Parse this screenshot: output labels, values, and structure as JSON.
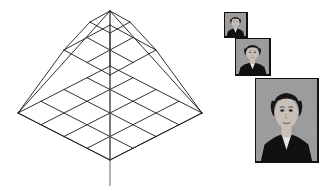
{
  "figure": {
    "background": "#ffffff",
    "line_color": "#1a1a1a"
  },
  "pyramid": {
    "name": "wireframe-image-pyramid",
    "apex": {
      "x": 110,
      "y": 12
    },
    "base_corners": {
      "left": {
        "x": 16,
        "y": 155
      },
      "top": {
        "x": 110,
        "y": 12
      },
      "right": {
        "x": 194,
        "y": 113
      },
      "front": {
        "x": 110,
        "y": 186
      }
    },
    "levels": [
      {
        "label": "level-3-apex",
        "divisions": 1,
        "center_y": 22,
        "half_width": 20,
        "half_height": 11
      },
      {
        "label": "level-2",
        "divisions": 2,
        "center_y": 50,
        "half_width": 46,
        "half_height": 25
      },
      {
        "label": "level-1-base",
        "divisions": 4,
        "center_y": 113,
        "half_width": 92,
        "half_height": 47
      }
    ],
    "axis": {
      "label": "vertical-center-axis",
      "x": 110,
      "y_top": 12,
      "y_bottom": 186
    }
  },
  "photos": {
    "name": "portrait-resolution-stack",
    "count": 3,
    "items": [
      {
        "label": "portrait-small",
        "x": 224,
        "y": 12,
        "width": 24,
        "height": 26,
        "scale": "1x",
        "border": "#111111"
      },
      {
        "label": "portrait-medium",
        "x": 235,
        "y": 38,
        "width": 36,
        "height": 38,
        "scale": "2x",
        "border": "#111111"
      },
      {
        "label": "portrait-large",
        "x": 255,
        "y": 78,
        "width": 64,
        "height": 85,
        "scale": "4x",
        "border": "#111111"
      }
    ],
    "palette": {
      "background_gray": "#9a9a9a",
      "hair_dark": "#161616",
      "jacket_dark": "#111111",
      "skin": "#c8c0b8",
      "shirt_light": "#e8e6e2"
    }
  }
}
